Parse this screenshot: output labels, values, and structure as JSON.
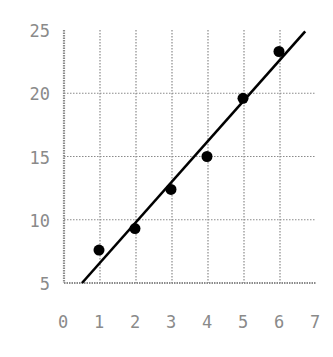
{
  "chart_data": {
    "type": "scatter",
    "title": "",
    "xlabel": "",
    "ylabel": "",
    "xlim": [
      0,
      7
    ],
    "ylim": [
      5,
      25
    ],
    "x_ticks": [
      0,
      1,
      2,
      3,
      4,
      5,
      6,
      7
    ],
    "y_ticks": [
      5,
      10,
      15,
      20,
      25
    ],
    "grid": true,
    "legend": null,
    "series": [
      {
        "name": "data",
        "x": [
          1,
          2,
          3,
          4,
          5,
          6
        ],
        "y": [
          7.6,
          9.3,
          12.4,
          15.0,
          19.6,
          23.3
        ]
      }
    ],
    "fit_line": {
      "x": [
        0.5,
        6.7
      ],
      "y": [
        5.0,
        24.9
      ]
    }
  },
  "colors": {
    "grid": "#8a8a8a",
    "axis": "#8a8a8a",
    "points": "#000000",
    "line": "#000000",
    "text": "#8a8a8a"
  }
}
